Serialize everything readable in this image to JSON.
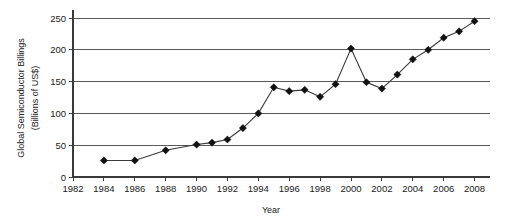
{
  "chart_data": {
    "type": "line",
    "title": "",
    "subtitle": "",
    "xlabel": "Year",
    "ylabel": "Global Semiconductor Billings\n(Billions of US$)",
    "ylabel_line1": "Global Semiconductor Billings",
    "ylabel_line2": "(Billions of US$)",
    "xlim": [
      1982,
      2009
    ],
    "ylim": [
      0,
      250
    ],
    "xticks": [
      1982,
      1984,
      1986,
      1988,
      1990,
      1992,
      1994,
      1996,
      1998,
      2000,
      2002,
      2004,
      2006,
      2008
    ],
    "xtick_labels": [
      "1982",
      "1984",
      "1986",
      "1988",
      "1990",
      "1992",
      "1994",
      "1996",
      "1998",
      "2000",
      "2002",
      "2004",
      "2006",
      "2008"
    ],
    "yticks": [
      0,
      50,
      100,
      150,
      200,
      250
    ],
    "ytick_labels": [
      "0",
      "50",
      "100",
      "150",
      "200",
      "250"
    ],
    "grid": "horizontal",
    "legend": "none",
    "marker": "diamond",
    "line_color": "#3a3a3a",
    "marker_color": "#111111",
    "grid_color": "#5a5a5a",
    "x": [
      1984,
      1986,
      1988,
      1990,
      1991,
      1992,
      1993,
      1994,
      1995,
      1996,
      1997,
      1998,
      1999,
      2000,
      2001,
      2002,
      2003,
      2004,
      2005,
      2006,
      2007,
      2008
    ],
    "values": [
      26,
      26,
      42,
      51,
      54,
      59,
      77,
      100,
      141,
      135,
      137,
      126,
      146,
      202,
      149,
      139,
      161,
      185,
      200,
      219,
      229,
      245
    ],
    "series": [
      {
        "name": "Global Semiconductor Billings",
        "x": [
          1984,
          1986,
          1988,
          1990,
          1991,
          1992,
          1993,
          1994,
          1995,
          1996,
          1997,
          1998,
          1999,
          2000,
          2001,
          2002,
          2003,
          2004,
          2005,
          2006,
          2007,
          2008
        ],
        "values": [
          26,
          26,
          42,
          51,
          54,
          59,
          77,
          100,
          141,
          135,
          137,
          126,
          146,
          202,
          149,
          139,
          161,
          185,
          200,
          219,
          229,
          245
        ]
      }
    ],
    "annotations": []
  }
}
